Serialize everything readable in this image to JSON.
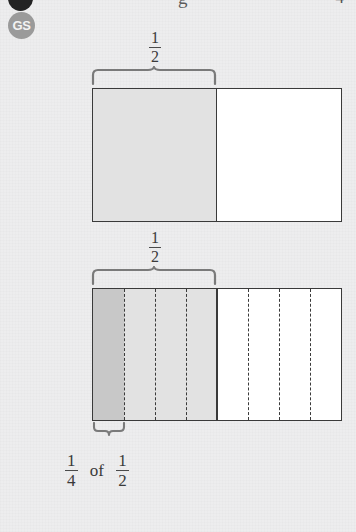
{
  "page": {
    "background_color": "#ededee",
    "ink_color": "#3a3a3a"
  },
  "header": {
    "badge_label": "GS",
    "partial_word": "g",
    "partial_page_number": "4"
  },
  "diagrams": [
    {
      "id": "whole-split-in-half",
      "brace_label_numerator": "1",
      "brace_label_denominator": "2",
      "shaded_fraction": "1/2",
      "shade_color": "#e2e2e2",
      "unshaded_color": "#ffffff",
      "columns": 2
    },
    {
      "id": "half-split-in-quarters",
      "brace_label_numerator": "1",
      "brace_label_denominator": "2",
      "columns": 8,
      "dashed_dividers": 6,
      "highlight_color": "#c8c8c8",
      "shade_color": "#e2e2e2",
      "unshaded_color": "#ffffff",
      "highlighted_columns": 1
    }
  ],
  "caption": {
    "first_numerator": "1",
    "first_denominator": "4",
    "connector": "of",
    "second_numerator": "1",
    "second_denominator": "2"
  }
}
